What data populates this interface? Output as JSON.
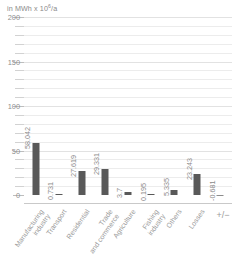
{
  "unit_caption": {
    "prefix": "in MWh x 10",
    "exponent": "6",
    "suffix": "/a"
  },
  "chart_data": {
    "type": "bar",
    "title": "",
    "subtitle": "",
    "xlabel": "",
    "ylabel": "in MWh x 10^6/a",
    "ylim": [
      -10,
      200
    ],
    "ytick_major": [
      0,
      50,
      100,
      150,
      200
    ],
    "ytick_major_labels": [
      "0",
      "50",
      "100",
      "150",
      "200"
    ],
    "ytick_minor": [
      10,
      20,
      30,
      40,
      60,
      70,
      80,
      90,
      110,
      120,
      130,
      140,
      160,
      170,
      180,
      190
    ],
    "grid": true,
    "legend": "none",
    "bar_color": "#595959",
    "categories": [
      "Manufacturing industry",
      "Transport",
      "Residential",
      "Trade and commerce",
      "Agriculture",
      "Fishing industry",
      "Others",
      "Losses",
      "+/-"
    ],
    "values": [
      58.042,
      0.731,
      27.619,
      29.331,
      3.7,
      0.195,
      5.335,
      23.243,
      -0.681
    ],
    "value_labels": [
      "58.042",
      "0.731",
      "27.619",
      "29.331",
      "3.7",
      "0.195",
      "5.335",
      "23.243",
      "-0.681"
    ]
  },
  "colors": {
    "bar": "#595959",
    "bar_negative": "#8c8c8c",
    "gridline": "#ececec",
    "gridline_major": "#e2e2e2",
    "axis": "#c9c9c9",
    "text": "#8a8a8a"
  }
}
